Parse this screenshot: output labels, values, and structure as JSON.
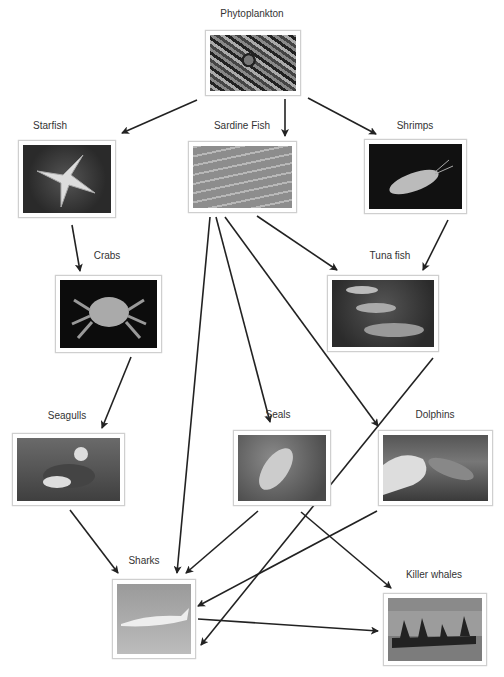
{
  "diagram": {
    "type": "food-web",
    "nodes": [
      {
        "id": "phytoplankton",
        "label": "Phytoplankton"
      },
      {
        "id": "starfish",
        "label": "Starfish"
      },
      {
        "id": "sardine",
        "label": "Sardine Fish"
      },
      {
        "id": "shrimps",
        "label": "Shrimps"
      },
      {
        "id": "crabs",
        "label": "Crabs"
      },
      {
        "id": "tuna",
        "label": "Tuna fish"
      },
      {
        "id": "seagulls",
        "label": "Seagulls"
      },
      {
        "id": "seals",
        "label": "Seals"
      },
      {
        "id": "dolphins",
        "label": "Dolphins"
      },
      {
        "id": "sharks",
        "label": "Sharks"
      },
      {
        "id": "killer_whales",
        "label": "Killer whales"
      }
    ],
    "edges": [
      {
        "from": "phytoplankton",
        "to": "starfish"
      },
      {
        "from": "phytoplankton",
        "to": "sardine"
      },
      {
        "from": "phytoplankton",
        "to": "shrimps"
      },
      {
        "from": "starfish",
        "to": "crabs"
      },
      {
        "from": "crabs",
        "to": "seagulls"
      },
      {
        "from": "seagulls",
        "to": "sharks"
      },
      {
        "from": "sardine",
        "to": "tuna"
      },
      {
        "from": "shrimps",
        "to": "tuna"
      },
      {
        "from": "sardine",
        "to": "sharks"
      },
      {
        "from": "sardine",
        "to": "seals"
      },
      {
        "from": "sardine",
        "to": "dolphins"
      },
      {
        "from": "tuna",
        "to": "sharks"
      },
      {
        "from": "seals",
        "to": "sharks"
      },
      {
        "from": "seals",
        "to": "killer_whales"
      },
      {
        "from": "dolphins",
        "to": "sharks"
      },
      {
        "from": "sharks",
        "to": "killer_whales"
      }
    ],
    "colors": {
      "arrow": "#222222",
      "label": "#333333",
      "frame": "#cfcfcf"
    }
  }
}
